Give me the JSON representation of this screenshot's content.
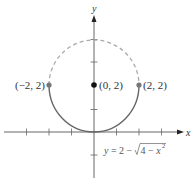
{
  "diagram": {
    "axes": {
      "x_label": "x",
      "y_label": "y",
      "x_ticks": [
        -3,
        -2,
        -1,
        1,
        2,
        3
      ],
      "y_ticks": [
        -1,
        1,
        2,
        3,
        4
      ]
    },
    "circle": {
      "center": [
        0,
        2
      ],
      "radius": 2,
      "solid_part": "lower semicircle",
      "dashed_part": "upper semicircle"
    },
    "points": [
      {
        "label": "(−2, 2)",
        "x": -2,
        "y": 2
      },
      {
        "label": "(0, 2)",
        "x": 0,
        "y": 2
      },
      {
        "label": "(2, 2)",
        "x": 2,
        "y": 2
      }
    ],
    "equation": {
      "lhs": "y",
      "mid": " = 2 − ",
      "radical_body": "4 − ",
      "var": "x",
      "exp": "2"
    },
    "colors": {
      "axis": "#555555",
      "curve_solid": "#666666",
      "curve_dashed": "#aaaaaa",
      "point_gray": "#777777",
      "point_center": "#111111"
    }
  }
}
